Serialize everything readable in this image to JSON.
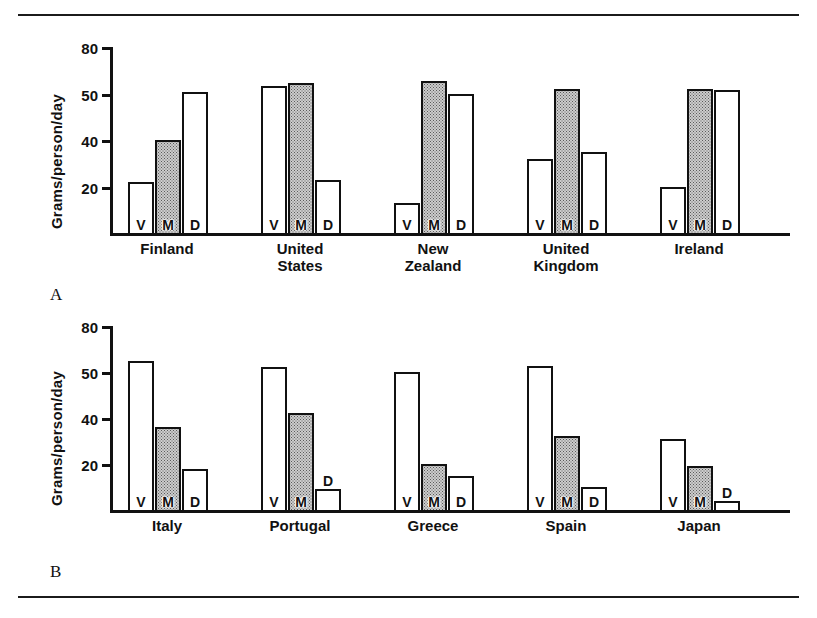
{
  "figure": {
    "panels": [
      {
        "letter": "A",
        "ylabel": "Grams/person/day",
        "yticks": [
          "80",
          "50",
          "40",
          "20"
        ],
        "groups": [
          {
            "label": "Finland",
            "label_lines": [
              "Finland"
            ]
          },
          {
            "label": "United States",
            "label_lines": [
              "United",
              "States"
            ]
          },
          {
            "label": "New Zealand",
            "label_lines": [
              "New",
              "Zealand"
            ]
          },
          {
            "label": "United Kingdom",
            "label_lines": [
              "United",
              "Kingdom"
            ]
          },
          {
            "label": "Ireland",
            "label_lines": [
              "Ireland"
            ]
          }
        ],
        "bar_letters": [
          "V",
          "M",
          "D"
        ]
      },
      {
        "letter": "B",
        "ylabel": "Grams/person/day",
        "yticks": [
          "80",
          "50",
          "40",
          "20"
        ],
        "groups": [
          {
            "label": "Italy",
            "label_lines": [
              "Italy"
            ]
          },
          {
            "label": "Portugal",
            "label_lines": [
              "Portugal"
            ]
          },
          {
            "label": "Greece",
            "label_lines": [
              "Greece"
            ]
          },
          {
            "label": "Spain",
            "label_lines": [
              "Spain"
            ]
          },
          {
            "label": "Japan",
            "label_lines": [
              "Japan"
            ]
          }
        ],
        "bar_letters": [
          "V",
          "M",
          "D"
        ]
      }
    ]
  },
  "chart_data": [
    {
      "type": "bar",
      "panel": "A",
      "title": "",
      "xlabel": "",
      "ylabel": "Grams/person/day",
      "ylim": [
        0,
        80
      ],
      "ytick_labels": [
        "20",
        "40",
        "50",
        "80"
      ],
      "ytick_positions": [
        20,
        40,
        50,
        80
      ],
      "grid": false,
      "legend": "none",
      "bar_codes": {
        "V": "Vegetable fat",
        "M": "Meat fat",
        "D": "Dairy fat"
      },
      "categories": [
        "Finland",
        "United States",
        "New Zealand",
        "United Kingdom",
        "Ireland"
      ],
      "series": [
        {
          "name": "V",
          "values": [
            22,
            55,
            13,
            32,
            20
          ]
        },
        {
          "name": "M",
          "values": [
            40,
            57,
            58,
            53,
            53
          ]
        },
        {
          "name": "D",
          "values": [
            51,
            23,
            50,
            35,
            52
          ]
        }
      ]
    },
    {
      "type": "bar",
      "panel": "B",
      "title": "",
      "xlabel": "",
      "ylabel": "Grams/person/day",
      "ylim": [
        0,
        80
      ],
      "ytick_labels": [
        "20",
        "40",
        "50",
        "80"
      ],
      "ytick_positions": [
        20,
        40,
        50,
        80
      ],
      "grid": false,
      "legend": "none",
      "bar_codes": {
        "V": "Vegetable fat",
        "M": "Meat fat",
        "D": "Dairy fat"
      },
      "categories": [
        "Italy",
        "Portugal",
        "Greece",
        "Spain",
        "Japan"
      ],
      "series": [
        {
          "name": "V",
          "values": [
            57,
            53,
            50,
            54,
            31
          ]
        },
        {
          "name": "M",
          "values": [
            36,
            41,
            20,
            32,
            19
          ]
        },
        {
          "name": "D",
          "values": [
            18,
            9,
            15,
            10,
            4
          ]
        }
      ]
    }
  ]
}
